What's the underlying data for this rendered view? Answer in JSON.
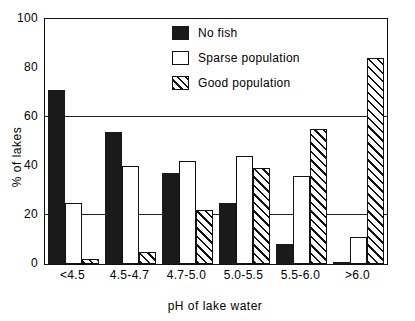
{
  "chart_data": {
    "type": "bar",
    "title": "",
    "xlabel": "pH of lake water",
    "ylabel": "% of lakes",
    "categories": [
      "<4.5",
      "4.5-4.7",
      "4.7-5.0",
      "5.0-5.5",
      "5.5-6.0",
      ">6.0"
    ],
    "series": [
      {
        "name": "No fish",
        "values": [
          71,
          54,
          37,
          25,
          8,
          1
        ],
        "style": "solid-black"
      },
      {
        "name": "Sparse population",
        "values": [
          25,
          40,
          42,
          44,
          36,
          11
        ],
        "style": "open-white"
      },
      {
        "name": "Good population",
        "values": [
          2,
          5,
          22,
          39,
          55,
          84
        ],
        "style": "diagonal-hatch"
      }
    ],
    "ylim": [
      0,
      100
    ],
    "yticks": [
      0,
      20,
      40,
      60,
      80,
      100
    ],
    "ytick_labels": [
      "0",
      "20",
      "40",
      "60",
      "80",
      "100"
    ],
    "gridlines": [
      20,
      60
    ],
    "grid": "horizontal-at-20-and-60",
    "legend_position": "top-center-right",
    "colors": {
      "no_fish": "#1a1a1a",
      "sparse_population": "#ffffff",
      "good_population": "#ffffff",
      "ink": "#111111",
      "background": "#ffffff"
    }
  },
  "legend": {
    "items": [
      {
        "label": "No fish"
      },
      {
        "label": "Sparse population"
      },
      {
        "label": "Good population"
      }
    ]
  }
}
